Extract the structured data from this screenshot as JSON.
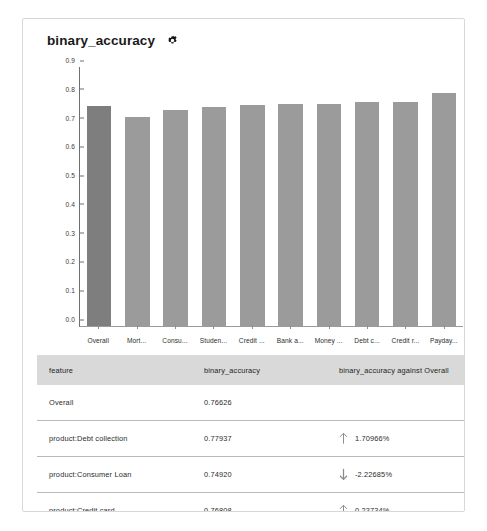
{
  "card": {
    "title": "binary_accuracy",
    "settings_icon": "gear-icon"
  },
  "chart_data": {
    "type": "bar",
    "title": "binary_accuracy",
    "xlabel": "",
    "ylabel": "",
    "ylim": [
      0.0,
      0.9
    ],
    "grid": false,
    "legend": null,
    "yticks": [
      "0.0",
      "0.1",
      "0.2",
      "0.3",
      "0.4",
      "0.5",
      "0.6",
      "0.7",
      "0.8",
      "0.9"
    ],
    "categories": [
      "Overall",
      "Mort...",
      "Consu...",
      "Studen...",
      "Credit ...",
      "Bank a...",
      "Money ...",
      "Debt c...",
      "Credit r...",
      "Payday..."
    ],
    "values": [
      0.766,
      0.727,
      0.749,
      0.762,
      0.768,
      0.772,
      0.773,
      0.779,
      0.78,
      0.808
    ],
    "highlight_index": 0,
    "colors": {
      "bar": "#9b9b9b",
      "bar_highlight": "#7e7e7e"
    }
  },
  "table": {
    "columns": [
      "feature",
      "binary_accuracy",
      "binary_accuracy against Overall",
      "example_"
    ],
    "rows": [
      {
        "feature": "Overall",
        "binary_accuracy": "0.76626",
        "against_overall": "",
        "direction": "none",
        "example": ""
      },
      {
        "feature": "product:Debt collection",
        "binary_accuracy": "0.77937",
        "against_overall": "1.70966%",
        "direction": "up",
        "example": ""
      },
      {
        "feature": "product:Consumer Loan",
        "binary_accuracy": "0.74920",
        "against_overall": "-2.22685%",
        "direction": "down",
        "example": ""
      },
      {
        "feature": "product:Credit card",
        "binary_accuracy": "0.76808",
        "against_overall": "0.23734%",
        "direction": "up",
        "example": ""
      }
    ]
  },
  "caption": ""
}
